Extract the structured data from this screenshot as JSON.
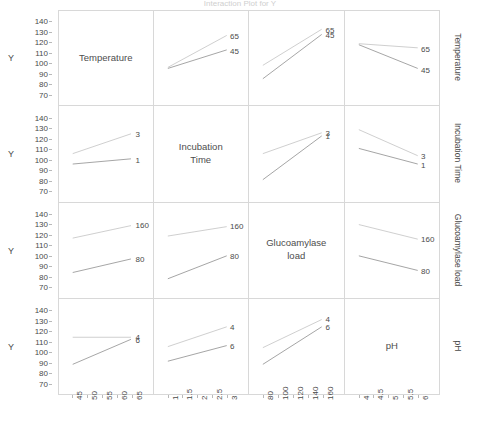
{
  "chart_data": {
    "type": "line",
    "title": "Interaction Plot for Y",
    "ylabel": "Y",
    "ylim": [
      65,
      145
    ],
    "yticks": [
      140,
      130,
      120,
      110,
      100,
      90,
      80,
      70
    ],
    "grid": false,
    "legend_position": "inline-right-endpoint-labels",
    "factors": [
      {
        "name": "Temperature",
        "levels": [
          "45",
          "65"
        ],
        "axis_ticks": [
          "45",
          "50",
          "55",
          "60",
          "65"
        ],
        "axis_range": [
          45,
          65
        ]
      },
      {
        "name": "Incubation Time",
        "display": "Incubation\nTime",
        "levels": [
          "1",
          "3"
        ],
        "axis_ticks": [
          "1",
          "1.5",
          "2",
          "2.5",
          "3"
        ],
        "axis_range": [
          1,
          3
        ]
      },
      {
        "name": "Glucoamylase load",
        "display": "Glucoamylase\nload",
        "levels": [
          "80",
          "160"
        ],
        "axis_ticks": [
          "80",
          "100",
          "120",
          "140",
          "160"
        ],
        "axis_range": [
          80,
          160
        ]
      },
      {
        "name": "pH",
        "display": "pH",
        "levels": [
          "4",
          "6"
        ],
        "axis_ticks": [
          "4",
          "4.5",
          "5",
          "5.5",
          "6"
        ],
        "axis_range": [
          4,
          6
        ]
      }
    ],
    "panels": [
      {
        "row": 0,
        "col": 0,
        "diagonal": true,
        "label": "Temperature"
      },
      {
        "row": 0,
        "col": 1,
        "diagonal": false,
        "x_factor": "Incubation Time",
        "trace_factor": "Temperature",
        "series": [
          {
            "name": "65",
            "values": [
              96.0,
              127.0
            ]
          },
          {
            "name": "45",
            "values": [
              95.0,
              113.0
            ]
          }
        ]
      },
      {
        "row": 0,
        "col": 2,
        "diagonal": false,
        "x_factor": "Glucoamylase load",
        "trace_factor": "Temperature",
        "series": [
          {
            "name": "65",
            "values": [
              98.0,
              133.0
            ]
          },
          {
            "name": "45",
            "values": [
              85.0,
              128.0
            ]
          }
        ]
      },
      {
        "row": 0,
        "col": 3,
        "diagonal": false,
        "x_factor": "pH",
        "trace_factor": "Temperature",
        "series": [
          {
            "name": "65",
            "values": [
              119.0,
              115.0
            ]
          },
          {
            "name": "45",
            "values": [
              118.0,
              95.0
            ]
          }
        ]
      },
      {
        "row": 1,
        "col": 0,
        "diagonal": false,
        "x_factor": "Temperature",
        "trace_factor": "Incubation Time",
        "series": [
          {
            "name": "3",
            "values": [
              105.0,
              124.0
            ]
          },
          {
            "name": "1",
            "values": [
              95.0,
              100.0
            ]
          }
        ]
      },
      {
        "row": 1,
        "col": 1,
        "diagonal": true,
        "label": "Incubation Time"
      },
      {
        "row": 1,
        "col": 2,
        "diagonal": false,
        "x_factor": "Glucoamylase load",
        "trace_factor": "Incubation Time",
        "series": [
          {
            "name": "3",
            "values": [
              105.0,
              125.0
            ]
          },
          {
            "name": "1",
            "values": [
              80.0,
              122.0
            ]
          }
        ]
      },
      {
        "row": 1,
        "col": 3,
        "diagonal": false,
        "x_factor": "pH",
        "trace_factor": "Incubation Time",
        "series": [
          {
            "name": "3",
            "values": [
              128.0,
              103.0
            ]
          },
          {
            "name": "1",
            "values": [
              110.0,
              95.0
            ]
          }
        ]
      },
      {
        "row": 2,
        "col": 0,
        "diagonal": false,
        "x_factor": "Temperature",
        "trace_factor": "Glucoamylase load",
        "series": [
          {
            "name": "160",
            "values": [
              117.0,
              129.0
            ]
          },
          {
            "name": "80",
            "values": [
              84.0,
              97.0
            ]
          }
        ]
      },
      {
        "row": 2,
        "col": 1,
        "diagonal": false,
        "x_factor": "Incubation Time",
        "trace_factor": "Glucoamylase load",
        "series": [
          {
            "name": "160",
            "values": [
              119.0,
              128.0
            ]
          },
          {
            "name": "80",
            "values": [
              78.0,
              100.0
            ]
          }
        ]
      },
      {
        "row": 2,
        "col": 2,
        "diagonal": true,
        "label": "Glucoamylase load"
      },
      {
        "row": 2,
        "col": 3,
        "diagonal": false,
        "x_factor": "pH",
        "trace_factor": "Glucoamylase load",
        "series": [
          {
            "name": "160",
            "values": [
              130.0,
              116.0
            ]
          },
          {
            "name": "80",
            "values": [
              100.0,
              86.0
            ]
          }
        ]
      },
      {
        "row": 3,
        "col": 0,
        "diagonal": false,
        "x_factor": "Temperature",
        "trace_factor": "pH",
        "series": [
          {
            "name": "4",
            "values": [
              114.0,
              114.0
            ]
          },
          {
            "name": "6",
            "values": [
              88.0,
              112.0
            ]
          }
        ]
      },
      {
        "row": 3,
        "col": 1,
        "diagonal": false,
        "x_factor": "Incubation Time",
        "trace_factor": "pH",
        "series": [
          {
            "name": "4",
            "values": [
              105.0,
              124.0
            ]
          },
          {
            "name": "6",
            "values": [
              91.0,
              106.0
            ]
          }
        ]
      },
      {
        "row": 3,
        "col": 2,
        "diagonal": false,
        "x_factor": "Glucoamylase load",
        "trace_factor": "pH",
        "series": [
          {
            "name": "4",
            "values": [
              104.0,
              131.0
            ]
          },
          {
            "name": "6",
            "values": [
              88.0,
              124.0
            ]
          }
        ]
      },
      {
        "row": 3,
        "col": 3,
        "diagonal": true,
        "label": "pH"
      }
    ],
    "row_titles": [
      "Temperature",
      "Incubation Time",
      "Glucoamylase load",
      "pH"
    ],
    "series_colors": {
      "upper": "#c9c9c9",
      "lower": "#9a9a9a"
    }
  }
}
